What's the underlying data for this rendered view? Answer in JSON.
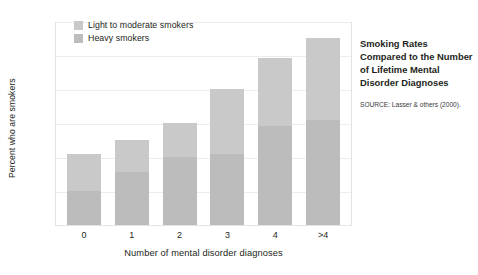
{
  "chart_data": {
    "type": "bar",
    "subtype": "stacked-vertical",
    "title": "",
    "xlabel": "Number of mental disorder diagnoses",
    "ylabel": "Percent who are smokers",
    "categories": [
      "0",
      "1",
      "2",
      "3",
      "4",
      ">4"
    ],
    "ylim": [
      0,
      60
    ],
    "yticks": [
      0,
      10,
      20,
      30,
      40,
      50,
      60
    ],
    "ytick_labels": [
      "0",
      "10",
      "20",
      "30",
      "40",
      "50",
      "60"
    ],
    "grid": true,
    "grid_axis": "y",
    "legend_position": "inside-top-left",
    "series": [
      {
        "name": "Heavy smokers",
        "color": "#bcbcbc",
        "values": [
          10,
          15.5,
          20,
          21,
          29,
          31
        ]
      },
      {
        "name": "Light to moderate smokers",
        "color": "#c9c9c9",
        "values": [
          11,
          9.5,
          10,
          19,
          20,
          24
        ]
      }
    ],
    "totals": [
      21,
      25,
      30,
      40,
      49,
      55
    ],
    "annotations": []
  },
  "legend": {
    "items": [
      {
        "label": "Light to moderate smokers",
        "color": "#c9c9c9"
      },
      {
        "label": "Heavy smokers",
        "color": "#bcbcbc"
      }
    ]
  },
  "caption": {
    "title": "Smoking Rates Compared to the Number of Lifetime Mental Disorder Diagnoses",
    "source": "SOURCE: Lasser & others (2000)."
  }
}
